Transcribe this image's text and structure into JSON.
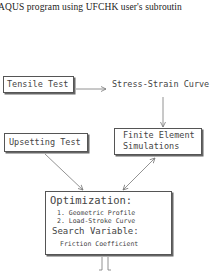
{
  "caption": "AQUS program using UFCHK user's subroutin",
  "nodes": {
    "tensile_test": {
      "label": "Tensile Test"
    },
    "stress_strain": {
      "label": "Stress-Strain Curve"
    },
    "upsetting_test": {
      "label": "Upsetting Test"
    },
    "finite_element": {
      "line1": "Finite Element",
      "line2": "Simulations"
    },
    "optimization": {
      "title": "Optimization:",
      "items": [
        "1. Geometric Profile",
        "2. Load-Stroke Curve"
      ],
      "search_label": "Search Variable:",
      "search_value": "Friction Coefficient"
    }
  },
  "edges": [
    {
      "from": "Tensile Test",
      "to": "Stress-Strain Curve",
      "direction": "forward"
    },
    {
      "from": "Stress-Strain Curve",
      "to": "Finite Element Simulations",
      "direction": "forward"
    },
    {
      "from": "Upsetting Test",
      "to": "Optimization",
      "direction": "forward"
    },
    {
      "from": "Finite Element Simulations",
      "to": "Optimization",
      "direction": "bidirectional"
    },
    {
      "from": "Optimization",
      "to": "below",
      "direction": "forward",
      "style": "hollow-double"
    }
  ],
  "colors": {
    "box_border": "#555555",
    "arrow": "#777777",
    "text": "#444444"
  }
}
